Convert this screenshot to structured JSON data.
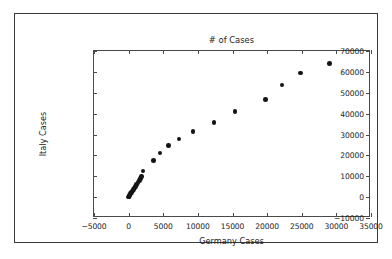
{
  "chart_data": {
    "type": "scatter",
    "title": "# of Cases",
    "xlabel": "Germany Cases",
    "ylabel": "Italy Cases",
    "xlim": [
      -5000,
      35000
    ],
    "ylim": [
      -10000,
      70000
    ],
    "xticks": [
      -5000,
      0,
      5000,
      10000,
      15000,
      20000,
      25000,
      30000,
      35000
    ],
    "yticks": [
      -10000,
      0,
      10000,
      20000,
      30000,
      40000,
      50000,
      60000,
      70000
    ],
    "xticklabels": [
      "-5000",
      "0",
      "5000",
      "10000",
      "15000",
      "20000",
      "25000",
      "30000",
      "35000"
    ],
    "yticklabels": [
      "-10000",
      "0",
      "10000",
      "20000",
      "30000",
      "40000",
      "50000",
      "60000",
      "70000"
    ],
    "grid": false,
    "legend": null,
    "marker_color": "#141414",
    "marker_size": 4.6,
    "series": [
      {
        "name": "Germany vs Italy Cases",
        "points": [
          [
            16,
            3
          ],
          [
            16,
            3
          ],
          [
            16,
            3
          ],
          [
            16,
            3
          ],
          [
            16,
            3
          ],
          [
            26,
            20
          ],
          [
            53,
            62
          ],
          [
            66,
            155
          ],
          [
            117,
            229
          ],
          [
            150,
            322
          ],
          [
            188,
            453
          ],
          [
            240,
            655
          ],
          [
            349,
            888
          ],
          [
            534,
            1128
          ],
          [
            684,
            1694
          ],
          [
            847,
            2036
          ],
          [
            902,
            2502
          ],
          [
            1139,
            3089
          ],
          [
            1296,
            3858
          ],
          [
            1567,
            4636
          ],
          [
            1908,
            5883
          ],
          [
            2078,
            7375
          ],
          [
            3675,
            9172
          ],
          [
            4585,
            10149
          ],
          [
            5795,
            12462
          ],
          [
            7272,
            17660
          ],
          [
            9257,
            21157
          ],
          [
            12327,
            24747
          ],
          [
            15320,
            27980
          ],
          [
            19848,
            31506
          ],
          [
            22213,
            35713
          ],
          [
            24873,
            41035
          ],
          [
            29056,
            47021
          ],
          [
            29056,
            53578
          ],
          [
            29056,
            59138
          ],
          [
            29056,
            63927
          ]
        ]
      }
    ],
    "rendered_points": [
      [
        16,
        3
      ],
      [
        40,
        150
      ],
      [
        80,
        400
      ],
      [
        140,
        700
      ],
      [
        200,
        1100
      ],
      [
        300,
        1600
      ],
      [
        420,
        2200
      ],
      [
        560,
        2900
      ],
      [
        700,
        3600
      ],
      [
        850,
        4400
      ],
      [
        1000,
        5200
      ],
      [
        1180,
        6100
      ],
      [
        1350,
        7000
      ],
      [
        1550,
        7900
      ],
      [
        1750,
        8900
      ],
      [
        1900,
        9800
      ],
      [
        2050,
        12500
      ],
      [
        3600,
        17600
      ],
      [
        4550,
        21200
      ],
      [
        5750,
        24700
      ],
      [
        7250,
        27900
      ],
      [
        9300,
        31500
      ],
      [
        12300,
        35800
      ],
      [
        15350,
        41000
      ],
      [
        19750,
        46900
      ],
      [
        22150,
        53800
      ],
      [
        24800,
        59500
      ],
      [
        29000,
        64000
      ]
    ]
  }
}
